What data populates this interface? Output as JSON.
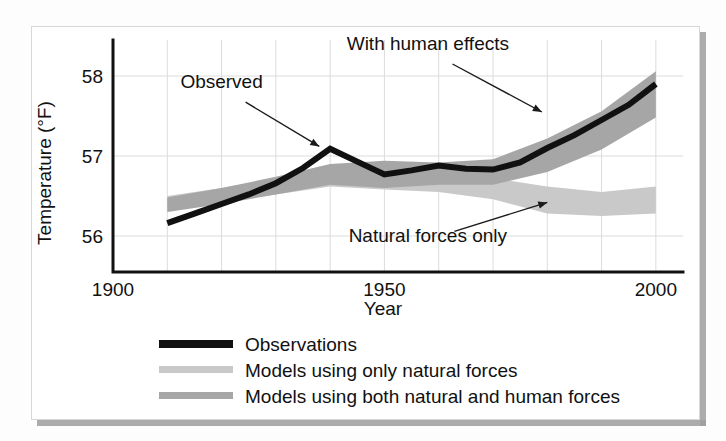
{
  "chart_data": {
    "type": "line",
    "title": "",
    "xlabel": "Year",
    "ylabel": "Temperature (°F)",
    "xlim": [
      1900,
      2005
    ],
    "ylim": [
      55.55,
      58.45
    ],
    "xticks": [
      1900,
      1950,
      2000
    ],
    "xticklabels": [
      "1900",
      "1950",
      "2000"
    ],
    "yticks": [
      56,
      57,
      58
    ],
    "yticklabels": [
      "56",
      "57",
      "58"
    ],
    "grid": true,
    "grid_x_step": 10,
    "grid_y_step": 1,
    "legend_position": "below-axes-left",
    "annotations": [
      {
        "text": "Observed",
        "x": 1920,
        "y": 57.85,
        "arrow_to_x": 1938,
        "arrow_to_y": 57.12
      },
      {
        "text": "With human effects",
        "x": 1958,
        "y": 58.32,
        "arrow_to_x": 1979,
        "arrow_to_y": 57.55
      },
      {
        "text": "Natural forces only",
        "x": 1958,
        "y": 55.92,
        "arrow_to_x": 1980,
        "arrow_to_y": 56.42
      }
    ],
    "series": [
      {
        "name": "Observations",
        "type": "line",
        "color": "#111111",
        "x": [
          1910,
          1915,
          1920,
          1925,
          1930,
          1935,
          1940,
          1945,
          1950,
          1955,
          1960,
          1965,
          1970,
          1975,
          1980,
          1985,
          1990,
          1995,
          2000
        ],
        "values": [
          56.16,
          56.28,
          56.4,
          56.52,
          56.66,
          56.85,
          57.09,
          56.93,
          56.77,
          56.82,
          56.88,
          56.84,
          56.83,
          56.92,
          57.1,
          57.26,
          57.45,
          57.64,
          57.9
        ]
      },
      {
        "name": "Models using only natural forces",
        "type": "band",
        "color": "#c9c9c9",
        "x": [
          1910,
          1920,
          1930,
          1940,
          1950,
          1960,
          1970,
          1980,
          1990,
          2000
        ],
        "lower": [
          56.33,
          56.42,
          56.52,
          56.62,
          56.58,
          56.55,
          56.46,
          56.28,
          56.25,
          56.28
        ],
        "upper": [
          56.5,
          56.6,
          56.72,
          56.86,
          56.88,
          56.8,
          56.72,
          56.62,
          56.55,
          56.62
        ]
      },
      {
        "name": "Models using both natural and human forces",
        "type": "band",
        "color": "#a6a6a6",
        "x": [
          1910,
          1920,
          1930,
          1940,
          1950,
          1960,
          1970,
          1980,
          1990,
          2000
        ],
        "lower": [
          56.3,
          56.4,
          56.52,
          56.64,
          56.6,
          56.64,
          56.64,
          56.8,
          57.08,
          57.48
        ],
        "upper": [
          56.48,
          56.6,
          56.74,
          56.9,
          56.94,
          56.92,
          56.96,
          57.22,
          57.56,
          58.06
        ]
      }
    ]
  },
  "legend": {
    "items": [
      {
        "label": "Observations",
        "swatch": "#111111",
        "style": "thick-line"
      },
      {
        "label": "Models using only natural forces",
        "swatch": "#c9c9c9",
        "style": "thick-line"
      },
      {
        "label": "Models using both natural and human forces",
        "swatch": "#a6a6a6",
        "style": "thick-line"
      }
    ]
  }
}
